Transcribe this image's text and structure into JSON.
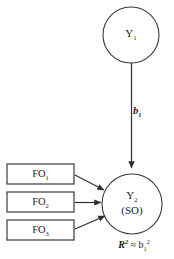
{
  "diagram": {
    "type": "path-model",
    "background_color": "#ffffff",
    "stroke_color": "#3a3a3a",
    "text_color": "#1d1d1d",
    "nodes": {
      "exogenous_construct": {
        "shape": "circle",
        "label_main": "Y",
        "label_sub": "1",
        "cx": 131,
        "cy": 35,
        "r": 28
      },
      "endogenous_construct": {
        "shape": "circle",
        "label_main": "Y",
        "label_sub": "2",
        "label_second_line": "(SO)",
        "cx": 132,
        "cy": 204,
        "r": 30
      }
    },
    "indicator_boxes": [
      {
        "label_main": "FO",
        "label_sub": "1",
        "x": 7,
        "y": 164,
        "w": 67,
        "h": 20
      },
      {
        "label_main": "FO",
        "label_sub": "2",
        "x": 7,
        "y": 192,
        "w": 67,
        "h": 20
      },
      {
        "label_main": "FO",
        "label_sub": "3",
        "x": 7,
        "y": 220,
        "w": 67,
        "h": 20
      }
    ],
    "path_coefficient": {
      "symbol": "b",
      "subscript": "1",
      "style": "bold-italic"
    },
    "variance_explained": {
      "symbol": "R",
      "symbol_exponent": "2",
      "relation": "≈",
      "term": "b",
      "term_subscript": "1",
      "term_exponent": "2",
      "full_text": "R² ≈ b₁²"
    },
    "edges": [
      {
        "from": "exogenous_construct",
        "to": "endogenous_construct",
        "kind": "directed",
        "label": "b1"
      },
      {
        "from": "indicator_box_1",
        "to": "endogenous_construct",
        "kind": "directed"
      },
      {
        "from": "indicator_box_2",
        "to": "endogenous_construct",
        "kind": "directed"
      },
      {
        "from": "indicator_box_3",
        "to": "endogenous_construct",
        "kind": "directed"
      }
    ]
  }
}
